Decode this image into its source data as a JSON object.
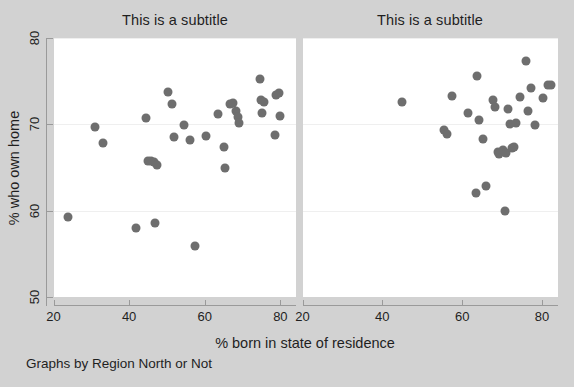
{
  "figure": {
    "background_color": "#d2d2d2",
    "panel_background_color": "#ffffff",
    "marker_color": "#6e6e6e",
    "axis_color": "#9a9a9a",
    "note": "Graphs by Region North or Not",
    "xlabel": "% born in state of residence",
    "ylabel": "% who own home"
  },
  "chart_data": {
    "type": "scatter",
    "title": "",
    "xlabel": "% born in state of residence",
    "ylabel": "% who own home",
    "note": "Graphs by Region North or Not",
    "xlim": [
      20,
      84
    ],
    "ylim": [
      50,
      80
    ],
    "xticks": [
      20,
      40,
      60,
      80
    ],
    "yticks": [
      50,
      60,
      70,
      80
    ],
    "grid": "horizontal-faint",
    "legend": "none",
    "panels": [
      {
        "subtitle": "This is a subtitle",
        "points": [
          {
            "x": 23.8,
            "y": 59.3
          },
          {
            "x": 30.9,
            "y": 69.7
          },
          {
            "x": 33.2,
            "y": 67.8
          },
          {
            "x": 41.9,
            "y": 58.0
          },
          {
            "x": 44.4,
            "y": 70.7
          },
          {
            "x": 45.0,
            "y": 65.7
          },
          {
            "x": 45.9,
            "y": 65.8
          },
          {
            "x": 46.6,
            "y": 65.6
          },
          {
            "x": 46.9,
            "y": 58.6
          },
          {
            "x": 47.5,
            "y": 65.3
          },
          {
            "x": 50.3,
            "y": 73.8
          },
          {
            "x": 51.4,
            "y": 72.3
          },
          {
            "x": 51.9,
            "y": 68.5
          },
          {
            "x": 54.5,
            "y": 69.9
          },
          {
            "x": 56.2,
            "y": 68.2
          },
          {
            "x": 57.4,
            "y": 55.9
          },
          {
            "x": 60.4,
            "y": 68.6
          },
          {
            "x": 63.6,
            "y": 71.2
          },
          {
            "x": 65.0,
            "y": 67.4
          },
          {
            "x": 65.4,
            "y": 65.0
          },
          {
            "x": 66.6,
            "y": 72.4
          },
          {
            "x": 67.4,
            "y": 72.5
          },
          {
            "x": 68.3,
            "y": 71.6
          },
          {
            "x": 68.7,
            "y": 70.8
          },
          {
            "x": 69.0,
            "y": 70.2
          },
          {
            "x": 74.6,
            "y": 75.3
          },
          {
            "x": 75.0,
            "y": 72.8
          },
          {
            "x": 75.8,
            "y": 72.6
          },
          {
            "x": 75.2,
            "y": 71.3
          },
          {
            "x": 78.5,
            "y": 68.8
          },
          {
            "x": 78.9,
            "y": 73.4
          },
          {
            "x": 79.6,
            "y": 73.6
          },
          {
            "x": 79.8,
            "y": 71.0
          }
        ]
      },
      {
        "subtitle": "This is a subtitle",
        "points": [
          {
            "x": 44.8,
            "y": 72.6
          },
          {
            "x": 55.5,
            "y": 69.4
          },
          {
            "x": 56.2,
            "y": 68.9
          },
          {
            "x": 57.4,
            "y": 73.3
          },
          {
            "x": 61.4,
            "y": 71.3
          },
          {
            "x": 63.4,
            "y": 62.0
          },
          {
            "x": 63.8,
            "y": 75.6
          },
          {
            "x": 64.3,
            "y": 70.5
          },
          {
            "x": 65.3,
            "y": 68.3
          },
          {
            "x": 66.0,
            "y": 62.8
          },
          {
            "x": 67.6,
            "y": 72.8
          },
          {
            "x": 68.3,
            "y": 72.0
          },
          {
            "x": 68.9,
            "y": 66.8
          },
          {
            "x": 69.3,
            "y": 66.6
          },
          {
            "x": 70.1,
            "y": 67.0
          },
          {
            "x": 70.8,
            "y": 60.0
          },
          {
            "x": 71.0,
            "y": 66.7
          },
          {
            "x": 71.6,
            "y": 71.8
          },
          {
            "x": 72.0,
            "y": 70.0
          },
          {
            "x": 72.4,
            "y": 67.3
          },
          {
            "x": 72.9,
            "y": 67.4
          },
          {
            "x": 73.4,
            "y": 70.2
          },
          {
            "x": 74.5,
            "y": 73.2
          },
          {
            "x": 75.9,
            "y": 77.3
          },
          {
            "x": 76.6,
            "y": 71.5
          },
          {
            "x": 77.3,
            "y": 74.2
          },
          {
            "x": 78.2,
            "y": 69.9
          },
          {
            "x": 80.2,
            "y": 73.0
          },
          {
            "x": 81.4,
            "y": 74.5
          },
          {
            "x": 82.3,
            "y": 74.6
          }
        ]
      }
    ]
  }
}
